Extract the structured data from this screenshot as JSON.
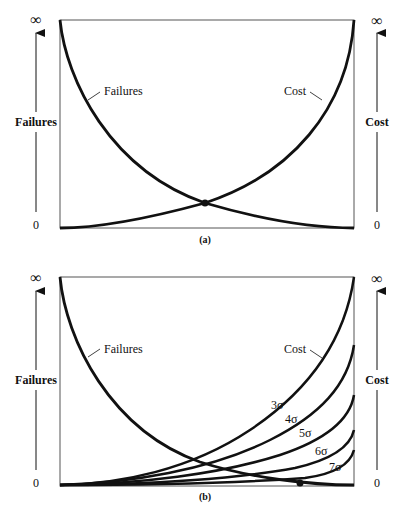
{
  "panel_a": {
    "caption": "(a)",
    "left_axis": {
      "label": "Failures",
      "top": "∞",
      "bottom": "0"
    },
    "right_axis": {
      "label": "Cost",
      "top": "∞",
      "bottom": "0"
    },
    "curve_labels": {
      "failures": "Failures",
      "cost": "Cost"
    }
  },
  "panel_b": {
    "caption": "(b)",
    "left_axis": {
      "label": "Failures",
      "top": "∞",
      "bottom": "0"
    },
    "right_axis": {
      "label": "Cost",
      "top": "∞",
      "bottom": "0"
    },
    "curve_labels": {
      "failures": "Failures",
      "cost": "Cost"
    },
    "sigma_labels": [
      "3σ",
      "4σ",
      "5σ",
      "6σ",
      "7σ"
    ]
  },
  "colors": {
    "line": "#111111",
    "frame": "#555555",
    "background": "#ffffff"
  }
}
